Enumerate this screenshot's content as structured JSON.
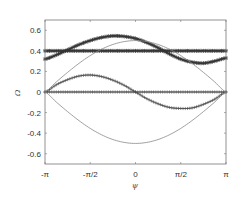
{
  "chart_data": {
    "type": "line",
    "title": "",
    "xlabel": "ψ",
    "ylabel": "Ω",
    "xlim": [
      -3.14159,
      3.14159
    ],
    "ylim": [
      -0.7,
      0.7
    ],
    "grid": false,
    "legend": null,
    "xticks": [
      {
        "value": -3.14159,
        "label": "-π"
      },
      {
        "value": -1.5708,
        "label": "-π/2"
      },
      {
        "value": 0,
        "label": "0"
      },
      {
        "value": 1.5708,
        "label": "π/2"
      },
      {
        "value": 3.14159,
        "label": "π"
      }
    ],
    "yticks": [
      {
        "value": 0.6,
        "label": "0.6"
      },
      {
        "value": 0.4,
        "label": "0.4"
      },
      {
        "value": 0.2,
        "label": "0.2"
      },
      {
        "value": 0,
        "label": "0"
      },
      {
        "value": -0.2,
        "label": "-0.2"
      },
      {
        "value": -0.4,
        "label": "-0.4"
      },
      {
        "value": -0.6,
        "label": "-0.6"
      }
    ],
    "x": [
      -3.1416,
      -2.7489,
      -2.3562,
      -1.9635,
      -1.5708,
      -1.1781,
      -0.7854,
      -0.3927,
      0,
      0.3927,
      0.7854,
      1.1781,
      1.5708,
      1.9635,
      2.3562,
      2.7489,
      3.1416
    ],
    "series": [
      {
        "name": "star-curve",
        "marker": "*",
        "style": "thick",
        "values": [
          0.32,
          0.36,
          0.41,
          0.46,
          0.5,
          0.53,
          0.545,
          0.54,
          0.52,
          0.48,
          0.43,
          0.37,
          0.32,
          0.29,
          0.28,
          0.3,
          0.33
        ]
      },
      {
        "name": "star-constant",
        "marker": "*",
        "style": "thick",
        "values": [
          0.4,
          0.4,
          0.4,
          0.4,
          0.4,
          0.4,
          0.4,
          0.4,
          0.4,
          0.4,
          0.4,
          0.4,
          0.4,
          0.4,
          0.4,
          0.4,
          0.4
        ]
      },
      {
        "name": "plus-curve",
        "marker": "+",
        "style": "thin",
        "values": [
          0,
          0.07,
          0.12,
          0.155,
          0.165,
          0.15,
          0.115,
          0.065,
          0,
          -0.065,
          -0.115,
          -0.15,
          -0.16,
          -0.155,
          -0.12,
          -0.07,
          0
        ]
      },
      {
        "name": "plus-constant",
        "marker": "+",
        "style": "thin",
        "values": [
          0,
          0,
          0,
          0,
          0,
          0,
          0,
          0,
          0,
          0,
          0,
          0,
          0,
          0,
          0,
          0,
          0
        ]
      },
      {
        "name": "upper-envelope",
        "marker": "none",
        "style": "thin-line",
        "values": [
          0,
          0.098,
          0.191,
          0.278,
          0.354,
          0.416,
          0.462,
          0.49,
          0.5,
          0.49,
          0.462,
          0.416,
          0.354,
          0.278,
          0.191,
          0.098,
          0
        ]
      },
      {
        "name": "lower-envelope",
        "marker": "none",
        "style": "thin-line",
        "values": [
          0,
          -0.098,
          -0.191,
          -0.278,
          -0.354,
          -0.416,
          -0.462,
          -0.49,
          -0.5,
          -0.49,
          -0.462,
          -0.416,
          -0.354,
          -0.278,
          -0.191,
          -0.098,
          0
        ]
      }
    ]
  },
  "colors": {
    "axes": "#555555",
    "line": "#333333",
    "thin_line": "#777777",
    "background": "#ffffff"
  }
}
